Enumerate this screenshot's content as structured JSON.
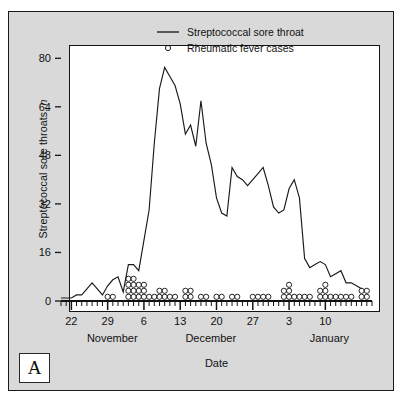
{
  "figure": {
    "panel_letter": "A",
    "background_color": "#d9d9d9",
    "plot_background_color": "#ffffff",
    "frame_color": "#1a1a1a"
  },
  "legend": {
    "position": "top-right-inside",
    "entries": [
      {
        "name": "line-entry",
        "symbol": "line",
        "label": "Streptococcal sore throat"
      },
      {
        "name": "circle-entry",
        "symbol": "open-circle",
        "label": "Rheumatic fever cases"
      }
    ]
  },
  "axes": {
    "y_title_main": "Streptococcal sore throats, ",
    "y_title_italic": "n",
    "x_title": "Date",
    "y_ticks": [
      0,
      16,
      32,
      48,
      64,
      80
    ],
    "y_range": [
      0,
      88
    ],
    "x_tick_labels": [
      "22",
      "29",
      "6",
      "13",
      "20",
      "27",
      "3",
      "10"
    ],
    "x_tick_days": [
      0,
      7,
      14,
      21,
      28,
      35,
      42,
      49
    ],
    "month_labels": [
      {
        "label": "November",
        "day": 3
      },
      {
        "label": "December",
        "day": 22
      },
      {
        "label": "January",
        "day": 46
      }
    ],
    "x_range": [
      -2,
      58
    ],
    "minor_tick_interval_days": 1,
    "grid": false
  },
  "chart_data": {
    "type": "line",
    "title": "",
    "subtitle": "",
    "xlabel": "Date",
    "ylabel": "Streptococcal sore throats, n",
    "ylim": [
      0,
      88
    ],
    "xlim": [
      -2,
      58
    ],
    "legend_position": "upper right",
    "grid": false,
    "x_tick_labels": [
      "22",
      "29",
      "6",
      "13",
      "20",
      "27",
      "3",
      "10"
    ],
    "x_tick_positions": [
      0,
      7,
      14,
      21,
      28,
      35,
      42,
      49
    ],
    "y_tick_labels": [
      "0",
      "16",
      "32",
      "48",
      "64",
      "80"
    ],
    "y_tick_positions": [
      0,
      16,
      32,
      48,
      64,
      80
    ],
    "series": [
      {
        "name": "Streptococcal sore throat",
        "type": "line",
        "color": "#1a1a1a",
        "x": [
          -2,
          -1,
          0,
          1,
          2,
          3,
          4,
          5,
          6,
          7,
          8,
          9,
          10,
          11,
          12,
          13,
          14,
          15,
          16,
          17,
          18,
          19,
          20,
          21,
          22,
          23,
          24,
          25,
          26,
          27,
          28,
          29,
          30,
          31,
          32,
          33,
          34,
          35,
          36,
          37,
          38,
          39,
          40,
          41,
          42,
          43,
          44,
          45,
          46,
          47,
          48,
          49,
          50,
          51,
          52,
          53,
          54,
          55,
          56
        ],
        "y": [
          1,
          1,
          1,
          2,
          2,
          4,
          6,
          4,
          2,
          5,
          7,
          8,
          3,
          12,
          12,
          10,
          20,
          30,
          52,
          70,
          77,
          74,
          71,
          65,
          55,
          58,
          51,
          66,
          52,
          45,
          34,
          29,
          28,
          44,
          41,
          40,
          38,
          40,
          42,
          44,
          38,
          31,
          29,
          30,
          37,
          40,
          34,
          14,
          11,
          12,
          13,
          12,
          8,
          9,
          10,
          6,
          6,
          5,
          4
        ]
      },
      {
        "name": "Rheumatic fever cases",
        "type": "stacked-dot",
        "marker": "open-circle",
        "color": "#1a1a1a",
        "dot_value_unit": 1,
        "counts_by_day": [
          {
            "x": 7,
            "count": 1
          },
          {
            "x": 8,
            "count": 1
          },
          {
            "x": 11,
            "count": 4
          },
          {
            "x": 12,
            "count": 4
          },
          {
            "x": 13,
            "count": 3
          },
          {
            "x": 14,
            "count": 3
          },
          {
            "x": 15,
            "count": 1
          },
          {
            "x": 16,
            "count": 1
          },
          {
            "x": 17,
            "count": 2
          },
          {
            "x": 18,
            "count": 2
          },
          {
            "x": 19,
            "count": 1
          },
          {
            "x": 20,
            "count": 1
          },
          {
            "x": 22,
            "count": 2
          },
          {
            "x": 23,
            "count": 2
          },
          {
            "x": 25,
            "count": 1
          },
          {
            "x": 26,
            "count": 1
          },
          {
            "x": 28,
            "count": 1
          },
          {
            "x": 29,
            "count": 1
          },
          {
            "x": 31,
            "count": 1
          },
          {
            "x": 32,
            "count": 1
          },
          {
            "x": 35,
            "count": 1
          },
          {
            "x": 36,
            "count": 1
          },
          {
            "x": 37,
            "count": 1
          },
          {
            "x": 38,
            "count": 1
          },
          {
            "x": 41,
            "count": 2
          },
          {
            "x": 42,
            "count": 3
          },
          {
            "x": 43,
            "count": 1
          },
          {
            "x": 44,
            "count": 1
          },
          {
            "x": 45,
            "count": 1
          },
          {
            "x": 46,
            "count": 1
          },
          {
            "x": 48,
            "count": 2
          },
          {
            "x": 49,
            "count": 3
          },
          {
            "x": 50,
            "count": 1
          },
          {
            "x": 51,
            "count": 1
          },
          {
            "x": 52,
            "count": 1
          },
          {
            "x": 53,
            "count": 1
          },
          {
            "x": 54,
            "count": 1
          },
          {
            "x": 56,
            "count": 2
          },
          {
            "x": 57,
            "count": 2
          }
        ]
      }
    ]
  }
}
